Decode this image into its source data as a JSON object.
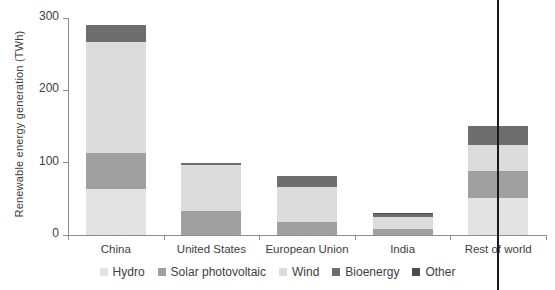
{
  "chart_data": {
    "type": "bar",
    "title": "",
    "subtitle": "",
    "xlabel": "",
    "ylabel": "Renewable energy generation (TWh)",
    "ylim": [
      0,
      300
    ],
    "yticks": [
      0,
      100,
      200,
      300
    ],
    "ytick_labels": [
      "0",
      "100",
      "200",
      "300"
    ],
    "grid": false,
    "stacked": true,
    "legend_position": "bottom",
    "categories": [
      "China",
      "United States",
      "European Union",
      "India",
      "Rest of world"
    ],
    "series": [
      {
        "name": "Hydro",
        "color": "#e3e3e3",
        "values": [
          63,
          0,
          0,
          0,
          51
        ]
      },
      {
        "name": "Solar photovoltaic",
        "color": "#a0a0a0",
        "values": [
          51,
          33,
          18,
          9,
          37
        ]
      },
      {
        "name": "Wind",
        "color": "#dcdcdc",
        "values": [
          153,
          64,
          49,
          16,
          36
        ]
      },
      {
        "name": "Bioenergy",
        "color": "#6e6e6e",
        "values": [
          23,
          3,
          14,
          4,
          27
        ]
      },
      {
        "name": "Other",
        "color": "#4a4a4a",
        "values": [
          0,
          0,
          0,
          2,
          0
        ]
      }
    ],
    "totals": [
      290,
      100,
      67,
      31,
      151
    ]
  },
  "legend": {
    "items": [
      {
        "label": "Hydro"
      },
      {
        "label": "Solar photovoltaic"
      },
      {
        "label": "Wind"
      },
      {
        "label": "Bioenergy"
      },
      {
        "label": "Other"
      }
    ]
  },
  "colors": {
    "hydro": "#e3e3e3",
    "solar": "#a0a0a0",
    "wind": "#dcdcdc",
    "bioenergy": "#6e6e6e",
    "other": "#4a4a4a",
    "axis": "#8d8d8d",
    "text": "#3d3d3d",
    "scan_line": "#1a1a1a"
  },
  "artifacts": {
    "scan_line_x": 497
  }
}
